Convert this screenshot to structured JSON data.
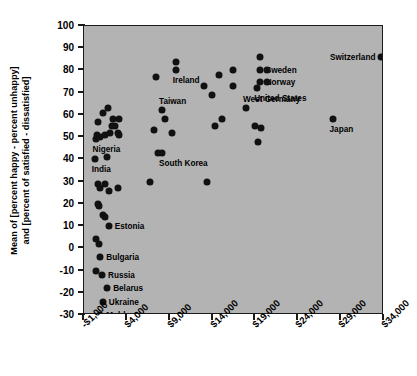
{
  "chart_data": {
    "type": "scatter",
    "title": "",
    "xlabel": "",
    "ylabel": "Mean of [percent happy - percent unhappy] and [percent of satisfied - dissatisfied]",
    "ylabel_line1": "Mean of [percent happy - percent unhappy]",
    "ylabel_line2": "and [percent of satisfied - dissatisfied]",
    "xlim": [
      -1000,
      34000
    ],
    "ylim": [
      -30,
      100
    ],
    "grid": false,
    "legend": "none",
    "plot_background": "#b3b3b3",
    "marker_color": "#111111",
    "xticks": [
      -1000,
      4000,
      9000,
      14000,
      19000,
      24000,
      29000,
      34000
    ],
    "xtick_labels": [
      "-$1,000",
      "$4,000",
      "$9,000",
      "$14,000",
      "$19,000",
      "$24,000",
      "$29,000",
      "$34,000"
    ],
    "yticks": [
      100,
      90,
      80,
      70,
      60,
      50,
      40,
      30,
      20,
      10,
      0,
      -10,
      -20,
      -30
    ],
    "ytick_labels": [
      "100",
      "90",
      "80",
      "70",
      "60",
      "50",
      "40",
      "30",
      "20",
      "10",
      "0",
      "-10",
      "-20",
      "-30"
    ],
    "points": [
      {
        "x": 1850,
        "y": 63,
        "label": ""
      },
      {
        "x": 1200,
        "y": 61,
        "label": ""
      },
      {
        "x": 600,
        "y": 57,
        "label": ""
      },
      {
        "x": 2350,
        "y": 58,
        "label": ""
      },
      {
        "x": 3100,
        "y": 58,
        "label": ""
      },
      {
        "x": 2300,
        "y": 55,
        "label": ""
      },
      {
        "x": 2650,
        "y": 55,
        "label": ""
      },
      {
        "x": 500,
        "y": 51,
        "label": ""
      },
      {
        "x": 1450,
        "y": 51,
        "label": ""
      },
      {
        "x": 2050,
        "y": 52,
        "label": ""
      },
      {
        "x": 2950,
        "y": 52,
        "label": ""
      },
      {
        "x": 3050,
        "y": 51,
        "label": ""
      },
      {
        "x": 350,
        "y": 49,
        "label": "Nigeria",
        "label_side": "below"
      },
      {
        "x": 900,
        "y": 50,
        "label": ""
      },
      {
        "x": 250,
        "y": 40,
        "label": "India",
        "label_side": "below"
      },
      {
        "x": 1700,
        "y": 41,
        "label": ""
      },
      {
        "x": 600,
        "y": 29,
        "label": ""
      },
      {
        "x": 1400,
        "y": 29,
        "label": ""
      },
      {
        "x": 900,
        "y": 27,
        "label": ""
      },
      {
        "x": 1900,
        "y": 26,
        "label": ""
      },
      {
        "x": 3000,
        "y": 27,
        "label": ""
      },
      {
        "x": 600,
        "y": 20,
        "label": ""
      },
      {
        "x": 700,
        "y": 19,
        "label": ""
      },
      {
        "x": 1250,
        "y": 15,
        "label": ""
      },
      {
        "x": 1400,
        "y": 14,
        "label": ""
      },
      {
        "x": 1900,
        "y": 10,
        "label": "Estonia",
        "label_side": "right"
      },
      {
        "x": 400,
        "y": 4,
        "label": ""
      },
      {
        "x": 700,
        "y": 2,
        "label": ""
      },
      {
        "x": 900,
        "y": -4,
        "label": "Bulgaria",
        "label_side": "right"
      },
      {
        "x": 400,
        "y": -10,
        "label": ""
      },
      {
        "x": 1100,
        "y": -12,
        "label": "Russia",
        "label_side": "right"
      },
      {
        "x": 1700,
        "y": -18,
        "label": "Belarus",
        "label_side": "right"
      },
      {
        "x": 1200,
        "y": -24,
        "label": "Ukraine",
        "label_side": "right"
      },
      {
        "x": 900,
        "y": -30,
        "label": "Moldova",
        "label_side": "right"
      },
      {
        "x": 7400,
        "y": 77,
        "label": ""
      },
      {
        "x": 9700,
        "y": 84,
        "label": ""
      },
      {
        "x": 9700,
        "y": 80,
        "label": "Ireland",
        "label_side": "below"
      },
      {
        "x": 8100,
        "y": 62,
        "label": "Taiwan",
        "label_side": "above"
      },
      {
        "x": 7200,
        "y": 53,
        "label": ""
      },
      {
        "x": 8400,
        "y": 58,
        "label": ""
      },
      {
        "x": 9300,
        "y": 52,
        "label": ""
      },
      {
        "x": 7600,
        "y": 43,
        "label": ""
      },
      {
        "x": 8100,
        "y": 43,
        "label": "South Korea",
        "label_side": "below"
      },
      {
        "x": 6700,
        "y": 30,
        "label": ""
      },
      {
        "x": 13000,
        "y": 73,
        "label": ""
      },
      {
        "x": 14700,
        "y": 78,
        "label": ""
      },
      {
        "x": 13900,
        "y": 69,
        "label": ""
      },
      {
        "x": 16400,
        "y": 80,
        "label": ""
      },
      {
        "x": 16400,
        "y": 73,
        "label": ""
      },
      {
        "x": 15100,
        "y": 58,
        "label": ""
      },
      {
        "x": 14300,
        "y": 55,
        "label": ""
      },
      {
        "x": 13400,
        "y": 30,
        "label": ""
      },
      {
        "x": 19500,
        "y": 86,
        "label": ""
      },
      {
        "x": 19500,
        "y": 80,
        "label": "Sweden",
        "label_side": "right"
      },
      {
        "x": 19500,
        "y": 75,
        "label": "Norway",
        "label_side": "right"
      },
      {
        "x": 20400,
        "y": 80,
        "label": ""
      },
      {
        "x": 20400,
        "y": 75,
        "label": ""
      },
      {
        "x": 19200,
        "y": 72,
        "label": "United States",
        "label_side": "below"
      },
      {
        "x": 17900,
        "y": 63,
        "label": "West Germany",
        "label_side": "above"
      },
      {
        "x": 18900,
        "y": 55,
        "label": ""
      },
      {
        "x": 19600,
        "y": 54,
        "label": ""
      },
      {
        "x": 19300,
        "y": 48,
        "label": ""
      },
      {
        "x": 28000,
        "y": 58,
        "label": "Japan",
        "label_side": "below"
      },
      {
        "x": 33700,
        "y": 86,
        "label": "Switzerland",
        "label_side": "left"
      }
    ]
  }
}
